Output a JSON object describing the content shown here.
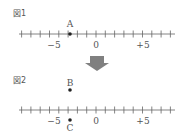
{
  "figure1": {
    "label": "図1",
    "point": {
      "name": "A",
      "value": -3
    },
    "tick_labels": [
      {
        "value": -5,
        "text": "−5"
      },
      {
        "value": 0,
        "text": "0"
      },
      {
        "value": 5,
        "text": "+5"
      }
    ],
    "range": [
      -8,
      8
    ]
  },
  "arrow": {
    "direction": "down",
    "color": "#808080"
  },
  "figure2": {
    "label": "図2",
    "points": [
      {
        "name": "B",
        "value": -3,
        "position": "above-line"
      },
      {
        "name": "C",
        "value": -3,
        "position": "below-line"
      }
    ],
    "tick_labels": [
      {
        "value": -5,
        "text": "−5"
      },
      {
        "value": 0,
        "text": "0"
      },
      {
        "value": 5,
        "text": "+5"
      }
    ],
    "range": [
      -8,
      8
    ]
  }
}
